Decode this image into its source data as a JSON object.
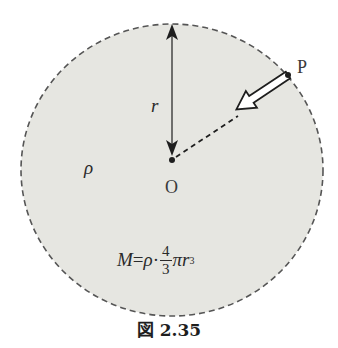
{
  "figure": {
    "caption": "図 2.35",
    "colors": {
      "sphere_fill": "#e6e6e1",
      "outline": "#555555",
      "ink": "#1e1e1e",
      "arrow_fill": "#ffffff",
      "background": "#ffffff"
    },
    "sphere": {
      "boundary_style": "dashed",
      "density_label": "ρ"
    },
    "center": {
      "label": "O"
    },
    "point": {
      "label": "P"
    },
    "radius": {
      "label": "r",
      "arrow": "double-headed, vertical from top of sphere to center O"
    },
    "force_arrow": {
      "style": "hollow block arrow",
      "direction": "from P toward O",
      "continuation": "dashed line to O"
    },
    "formula": {
      "lhs": "M",
      "equals": "=",
      "rho": "ρ",
      "dot": "·",
      "frac_num": "4",
      "frac_den": "3",
      "pi": "π",
      "r": "r",
      "exp": "3",
      "text": "M = ρ·(4/3)πr³"
    }
  }
}
